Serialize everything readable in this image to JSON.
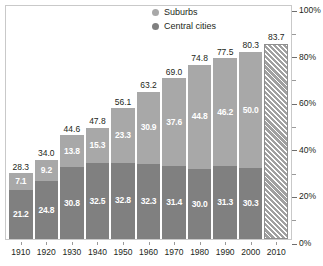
{
  "chart_data": {
    "type": "bar",
    "subtype": "stacked-bar",
    "title": "",
    "subtitle": "",
    "xlabel": "",
    "ylabel": "",
    "ylim": [
      0,
      100
    ],
    "y_major_ticks": [
      "0%",
      "20%",
      "40%",
      "60%",
      "80%",
      "100%"
    ],
    "y_minor_ticks": [
      "10%",
      "30%",
      "50%",
      "70%",
      "90%"
    ],
    "grid": false,
    "legend_position": "top-center",
    "categories": [
      "1910",
      "1920",
      "1930",
      "1940",
      "1950",
      "1960",
      "1970",
      "1980",
      "1990",
      "2000",
      "2010"
    ],
    "series": [
      {
        "name": "Suburbs",
        "values": [
          7.1,
          9.2,
          13.8,
          15.3,
          23.3,
          30.9,
          37.6,
          44.8,
          46.2,
          50.0,
          null
        ]
      },
      {
        "name": "Central cities",
        "values": [
          21.2,
          24.8,
          30.8,
          32.5,
          32.8,
          32.3,
          31.4,
          30.0,
          31.3,
          30.3,
          null
        ]
      }
    ],
    "totals": [
      28.3,
      34.0,
      44.6,
      47.8,
      56.1,
      63.2,
      69.0,
      74.8,
      77.5,
      80.3,
      83.7
    ]
  },
  "legend": {
    "items": [
      {
        "label": "Suburbs",
        "color": "#a8a8a8"
      },
      {
        "label": "Central cities",
        "color": "#808080"
      }
    ]
  },
  "colors": {
    "suburbs": "#a8a8a8",
    "central_cities": "#808080",
    "hatch": "#a0a0a0",
    "frame": "#c9c9c9",
    "text": "#231f20",
    "value_text": "#ffffff"
  },
  "bars": [
    {
      "year": "1910",
      "total": "28.3",
      "suburbs": "7.1",
      "central": "21.2",
      "suburbs_val": 7.1,
      "central_val": 21.2,
      "hatched": false
    },
    {
      "year": "1920",
      "total": "34.0",
      "suburbs": "9.2",
      "central": "24.8",
      "suburbs_val": 9.2,
      "central_val": 24.8,
      "hatched": false
    },
    {
      "year": "1930",
      "total": "44.6",
      "suburbs": "13.8",
      "central": "30.8",
      "suburbs_val": 13.8,
      "central_val": 30.8,
      "hatched": false
    },
    {
      "year": "1940",
      "total": "47.8",
      "suburbs": "15.3",
      "central": "32.5",
      "suburbs_val": 15.3,
      "central_val": 32.5,
      "hatched": false
    },
    {
      "year": "1950",
      "total": "56.1",
      "suburbs": "23.3",
      "central": "32.8",
      "suburbs_val": 23.3,
      "central_val": 32.8,
      "hatched": false
    },
    {
      "year": "1960",
      "total": "63.2",
      "suburbs": "30.9",
      "central": "32.3",
      "suburbs_val": 30.9,
      "central_val": 32.3,
      "hatched": false
    },
    {
      "year": "1970",
      "total": "69.0",
      "suburbs": "37.6",
      "central": "31.4",
      "suburbs_val": 37.6,
      "central_val": 31.4,
      "hatched": false
    },
    {
      "year": "1980",
      "total": "74.8",
      "suburbs": "44.8",
      "central": "30.0",
      "suburbs_val": 44.8,
      "central_val": 30.0,
      "hatched": false
    },
    {
      "year": "1990",
      "total": "77.5",
      "suburbs": "46.2",
      "central": "31.3",
      "suburbs_val": 46.2,
      "central_val": 31.3,
      "hatched": false
    },
    {
      "year": "2000",
      "total": "80.3",
      "suburbs": "50.0",
      "central": "30.3",
      "suburbs_val": 50.0,
      "central_val": 30.3,
      "hatched": false
    },
    {
      "year": "2010",
      "total": "83.7",
      "suburbs": "",
      "central": "",
      "suburbs_val": 0,
      "central_val": 83.7,
      "hatched": true
    }
  ],
  "yaxis": {
    "ticks": [
      {
        "label": "100%",
        "value": 100,
        "major": true
      },
      {
        "label": "",
        "value": 90,
        "major": false
      },
      {
        "label": "80%",
        "value": 80,
        "major": true
      },
      {
        "label": "",
        "value": 70,
        "major": false
      },
      {
        "label": "60%",
        "value": 60,
        "major": true
      },
      {
        "label": "",
        "value": 50,
        "major": false
      },
      {
        "label": "40%",
        "value": 40,
        "major": true
      },
      {
        "label": "",
        "value": 30,
        "major": false
      },
      {
        "label": "20%",
        "value": 20,
        "major": true
      },
      {
        "label": "",
        "value": 10,
        "major": false
      },
      {
        "label": "0%",
        "value": 0,
        "major": true
      }
    ]
  }
}
